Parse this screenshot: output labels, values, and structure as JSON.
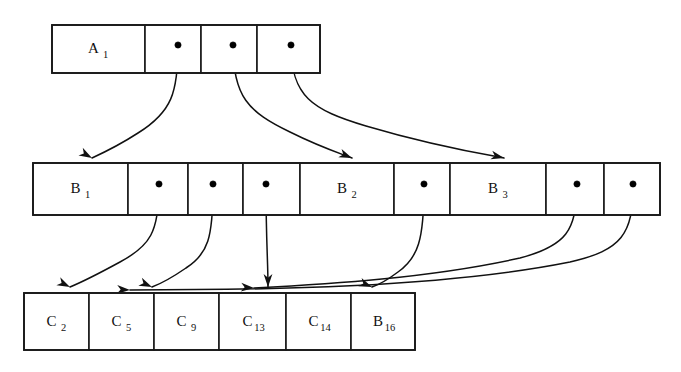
{
  "figure": {
    "type": "diagram",
    "background_color": "#ffffff",
    "line_color": "#111111",
    "text_color": "#111111",
    "width": 681,
    "height": 372
  },
  "rows": [
    {
      "id": "row-a",
      "name": "top-index-row",
      "x": 52,
      "y": 25,
      "height": 48,
      "cells": [
        {
          "id": "a-0",
          "kind": "key",
          "label": "A",
          "sub": "1",
          "x": 52,
          "w": 93
        },
        {
          "id": "a-1",
          "kind": "pointer",
          "label": "",
          "sub": "",
          "x": 145,
          "w": 56
        },
        {
          "id": "a-2",
          "kind": "pointer",
          "label": "",
          "sub": "",
          "x": 201,
          "w": 56
        },
        {
          "id": "a-3",
          "kind": "pointer",
          "label": "",
          "sub": "",
          "x": 257,
          "w": 63
        }
      ]
    },
    {
      "id": "row-b",
      "name": "middle-index-row",
      "x": 33,
      "y": 163,
      "height": 52,
      "cells": [
        {
          "id": "b-0",
          "kind": "key",
          "label": "B",
          "sub": "1",
          "x": 33,
          "w": 95
        },
        {
          "id": "b-1",
          "kind": "pointer",
          "label": "",
          "sub": "",
          "x": 128,
          "w": 60
        },
        {
          "id": "b-2",
          "kind": "pointer",
          "label": "",
          "sub": "",
          "x": 188,
          "w": 55
        },
        {
          "id": "b-3",
          "kind": "pointer",
          "label": "",
          "sub": "",
          "x": 243,
          "w": 57
        },
        {
          "id": "b-4",
          "kind": "key",
          "label": "B",
          "sub": "2",
          "x": 300,
          "w": 94
        },
        {
          "id": "b-5",
          "kind": "pointer",
          "label": "",
          "sub": "",
          "x": 394,
          "w": 56
        },
        {
          "id": "b-6",
          "kind": "key",
          "label": "B",
          "sub": "3",
          "x": 450,
          "w": 96
        },
        {
          "id": "b-7",
          "kind": "pointer",
          "label": "",
          "sub": "",
          "x": 546,
          "w": 58
        },
        {
          "id": "b-8",
          "kind": "pointer",
          "label": "",
          "sub": "",
          "x": 604,
          "w": 56
        }
      ]
    },
    {
      "id": "row-c",
      "name": "leaf-row",
      "x": 24,
      "y": 293,
      "height": 57,
      "cells": [
        {
          "id": "c-0",
          "kind": "key",
          "label": "C",
          "sub": "2",
          "x": 24,
          "w": 65
        },
        {
          "id": "c-1",
          "kind": "key",
          "label": "C",
          "sub": "5",
          "x": 89,
          "w": 65
        },
        {
          "id": "c-2",
          "kind": "key",
          "label": "C",
          "sub": "9",
          "x": 154,
          "w": 65
        },
        {
          "id": "c-3",
          "kind": "key",
          "label": "C",
          "sub": "13",
          "x": 219,
          "w": 67
        },
        {
          "id": "c-4",
          "kind": "key",
          "label": "C",
          "sub": "14",
          "x": 286,
          "w": 65
        },
        {
          "id": "c-5",
          "kind": "key",
          "label": "B",
          "sub": "16",
          "x": 351,
          "w": 64
        }
      ]
    }
  ],
  "pointers": [
    {
      "id": "p-a1",
      "row": "row-a",
      "cell": "a-1",
      "dot_x": 178,
      "dot_y": 45
    },
    {
      "id": "p-a2",
      "row": "row-a",
      "cell": "a-2",
      "dot_x": 233,
      "dot_y": 45
    },
    {
      "id": "p-a3",
      "row": "row-a",
      "cell": "a-3",
      "dot_x": 291,
      "dot_y": 45
    },
    {
      "id": "p-b1",
      "row": "row-b",
      "cell": "b-1",
      "dot_x": 159,
      "dot_y": 184
    },
    {
      "id": "p-b2",
      "row": "row-b",
      "cell": "b-2",
      "dot_x": 213,
      "dot_y": 184
    },
    {
      "id": "p-b3",
      "row": "row-b",
      "cell": "b-3",
      "dot_x": 266,
      "dot_y": 184
    },
    {
      "id": "p-b5",
      "row": "row-b",
      "cell": "b-5",
      "dot_x": 424,
      "dot_y": 184
    },
    {
      "id": "p-b7",
      "row": "row-b",
      "cell": "b-7",
      "dot_x": 577,
      "dot_y": 184
    },
    {
      "id": "p-b8",
      "row": "row-b",
      "cell": "b-8",
      "dot_x": 633,
      "dot_y": 184
    }
  ],
  "links": [
    {
      "id": "l-a1-b0",
      "from": "p-a1",
      "to": "b-0",
      "path": "M 178 46 C 178 92 172 112 138 133 C 118 146 105 152 92 158",
      "head_x": 92,
      "head_y": 158,
      "head_angle": 29
    },
    {
      "id": "l-a2-b4",
      "from": "p-a2",
      "to": "b-4",
      "path": "M 233 46 C 233 96 248 112 290 132 C 318 146 336 152 352 158",
      "head_x": 352,
      "head_y": 158,
      "head_angle": 22
    },
    {
      "id": "l-a3-b6",
      "from": "p-a3",
      "to": "b-6",
      "path": "M 291 46 C 291 96 312 110 366 126 C 430 145 476 153 504 158",
      "head_x": 504,
      "head_y": 158,
      "head_angle": 13
    },
    {
      "id": "l-b1-c0",
      "from": "p-b1",
      "to": "c-0",
      "path": "M 159 186 C 159 232 150 246 120 262 C 98 274 82 282 70 287",
      "head_x": 70,
      "head_y": 287,
      "head_angle": 26
    },
    {
      "id": "l-b2-c1",
      "from": "p-b2",
      "to": "c-1",
      "path": "M 213 186 C 213 238 208 254 186 268 C 170 279 160 284 152 287",
      "head_x": 152,
      "head_y": 287,
      "head_angle": 24
    },
    {
      "id": "l-b3-c2",
      "from": "p-b3",
      "to": "c-2",
      "path": "M 266 186 C 266 240 268 262 268 287",
      "head_x": 268,
      "head_y": 287,
      "head_angle": 90
    },
    {
      "id": "l-b5-c4",
      "from": "p-b5",
      "to": "c-4",
      "path": "M 424 186 C 424 240 418 258 398 272 C 386 281 378 285 372 287",
      "head_x": 372,
      "head_y": 287,
      "head_angle": 22
    },
    {
      "id": "l-b7-c3",
      "from": "p-b7",
      "to": "c-3",
      "path": "M 577 186 C 577 230 566 246 520 258 C 430 278 330 284 254 288",
      "head_x": 254,
      "head_y": 288,
      "head_angle": 4
    },
    {
      "id": "l-b8-c1b",
      "from": "p-b8",
      "to": "c-1",
      "path": "M 633 186 C 633 234 622 250 570 262 C 440 288 260 290 130 290",
      "head_x": 130,
      "head_y": 290,
      "head_angle": 3
    }
  ]
}
